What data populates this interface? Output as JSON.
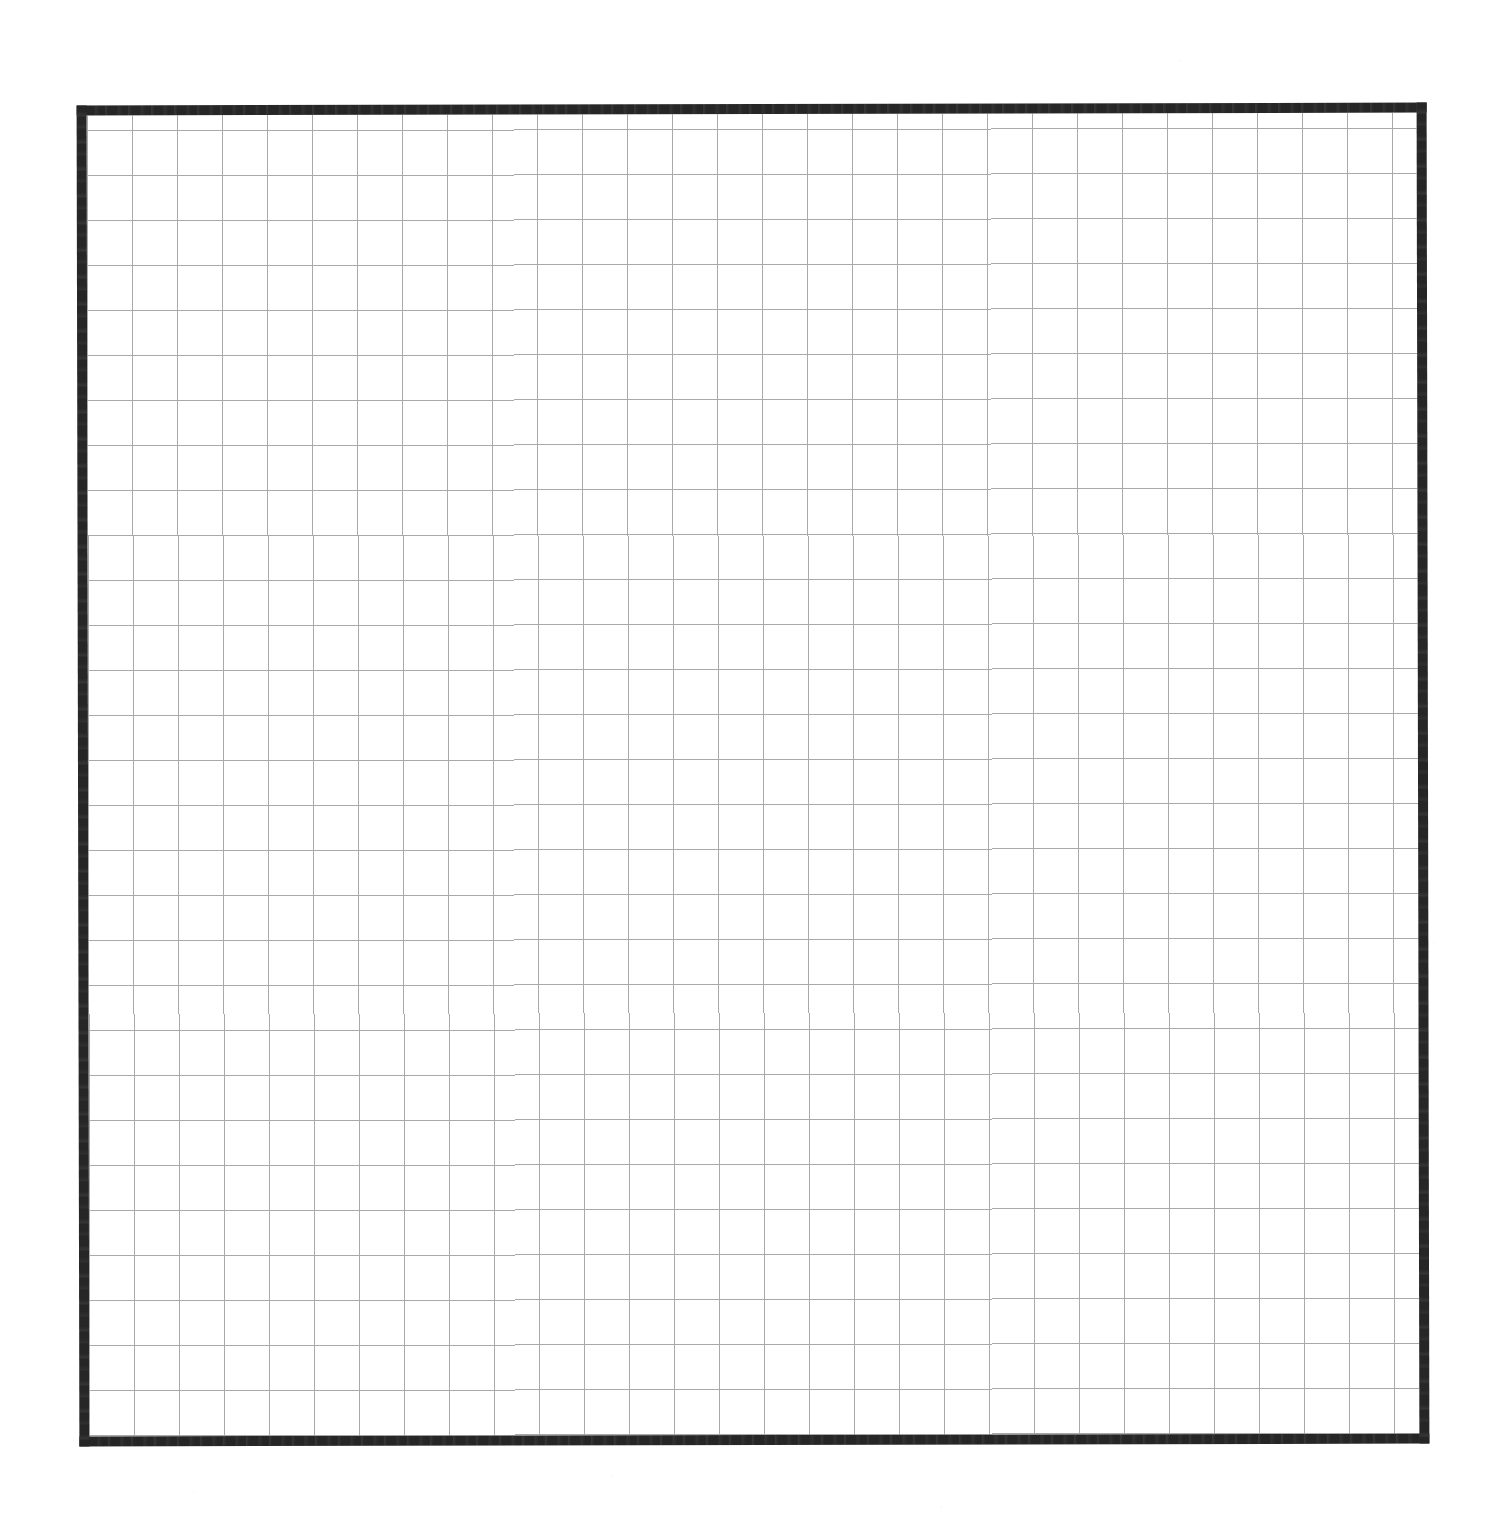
{
  "document": {
    "kind": "graph-paper-sheet",
    "description": "Blank scanned sheet of square graph paper enclosed by a heavy hand-drawn rectangular border. No text, labels, axes, tick values, legend or plotted data appear anywhere in the image.",
    "page_background_color": "#ffffff",
    "has_text": false,
    "has_data_marks": false
  },
  "frame": {
    "name": "outer-border-rectangle",
    "color": "#262626",
    "stroke_width_px": 10,
    "left_px": 78,
    "top_px": 104,
    "width_px": 1350,
    "height_px": 1341,
    "rotation_deg": -0.12,
    "style": "hand-drawn / scanned ink, slightly irregular edges"
  },
  "grid": {
    "name": "square-grid",
    "line_color": "#a9a9a9",
    "line_width_px": 1,
    "cell_size_px": 45,
    "columns": 30,
    "rows": 30,
    "minor_grid": false,
    "origin_offset_x_px": 0,
    "origin_offset_y_px": 0
  },
  "chart_data": {
    "type": "table",
    "title": "",
    "subtitle": "",
    "xlabel": "",
    "ylabel": "",
    "grid": true,
    "legend_position": "none",
    "categories": [],
    "values": [],
    "series": [],
    "annotations": [],
    "xticklabels": [],
    "yticklabels": [],
    "note": "Empty graph paper: a blank 30 x 30 square grid inside a heavy black border. There are no plotted series, no data points, no axis tick labels and no annotations rendered in the image."
  }
}
